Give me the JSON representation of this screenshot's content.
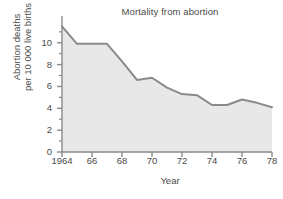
{
  "chart_data": {
    "type": "area",
    "title": "Mortality from abortion",
    "xlabel": "Year",
    "ylabel": "Abortion deaths per 10 000 live births",
    "ylabel_lines": [
      "Abortion deaths",
      "per 10 000 live births"
    ],
    "x": [
      1964,
      1965,
      1966,
      1967,
      1968,
      1969,
      1970,
      1971,
      1972,
      1973,
      1974,
      1975,
      1976,
      1977,
      1978
    ],
    "values": [
      11.5,
      9.9,
      9.9,
      9.9,
      8.3,
      6.6,
      6.8,
      5.9,
      5.3,
      5.2,
      4.3,
      4.3,
      4.8,
      4.5,
      4.1
    ],
    "series": [
      {
        "name": "Abortion deaths per 10 000 live births",
        "values": [
          11.5,
          9.9,
          9.9,
          9.9,
          8.3,
          6.6,
          6.8,
          5.9,
          5.3,
          5.2,
          4.3,
          4.3,
          4.8,
          4.5,
          4.1
        ]
      }
    ],
    "xlim": [
      1964,
      1978
    ],
    "ylim": [
      0,
      11.9
    ],
    "ytick_values": [
      0,
      2,
      4,
      6,
      8,
      10
    ],
    "ytick_labels": [
      "0",
      "2",
      "4",
      "6",
      "8",
      "10"
    ],
    "yminor_values": [
      1,
      3,
      5,
      7,
      9,
      11
    ],
    "xtick_values": [
      1964,
      1966,
      1968,
      1970,
      1972,
      1974,
      1976,
      1978
    ],
    "xtick_labels": [
      "1964",
      "66",
      "68",
      "70",
      "72",
      "74",
      "76",
      "78"
    ],
    "grid": false,
    "legend": "none",
    "colors": {
      "line": "#8a8a8a",
      "fill": "#e8e8e8",
      "axis": "#8a8a8a",
      "text": "#4a4a4a",
      "background": "#ffffff"
    }
  }
}
